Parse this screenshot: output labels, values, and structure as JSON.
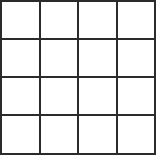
{
  "grid": {
    "rows": 4,
    "cols": 4,
    "x_lines": [
      1,
      40,
      78,
      117,
      155
    ],
    "y_lines": [
      1,
      39,
      77,
      115,
      154
    ],
    "line_color": "#2b2b2b",
    "background_color": "#ffffff",
    "cells": [
      [
        "",
        "",
        "",
        ""
      ],
      [
        "",
        "",
        "",
        ""
      ],
      [
        "",
        "",
        "",
        ""
      ],
      [
        "",
        "",
        "",
        ""
      ]
    ]
  }
}
